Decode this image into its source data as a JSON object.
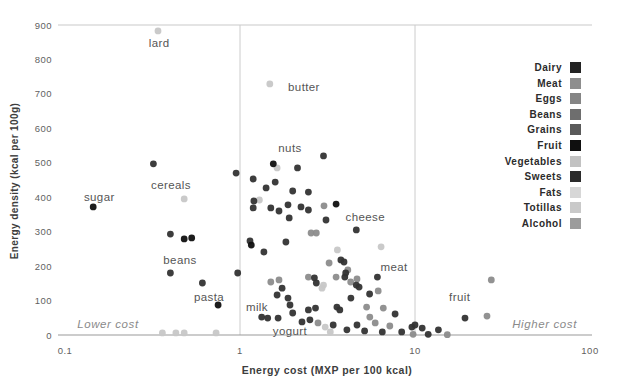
{
  "chart_data": {
    "type": "scatter",
    "title": "",
    "xlabel": "Energy cost (MXP per 100 kcal)",
    "ylabel": "Energy density (kcal per 100g)",
    "x_scale": "log",
    "xlim": [
      0.1,
      100
    ],
    "ylim": [
      0,
      900
    ],
    "x_ticks": [
      0.1,
      1,
      10,
      100
    ],
    "x_tick_labels": [
      "0.1",
      "1",
      "10",
      "100"
    ],
    "y_ticks": [
      0,
      100,
      200,
      300,
      400,
      500,
      600,
      700,
      800,
      900
    ],
    "reference_lines_x": [
      1,
      10
    ],
    "grid": "top-line-and-baseline-only",
    "legend_position": "right",
    "palette": {
      "black": "#101010",
      "dark": "#333333",
      "medium": "#8c8c8c",
      "light": "#c7c7c7"
    },
    "points": [
      [
        0.34,
        883,
        "light"
      ],
      [
        1.48,
        729,
        "light"
      ],
      [
        0.48,
        395,
        "light"
      ],
      [
        1.63,
        485,
        "light"
      ],
      [
        1.29,
        392,
        "light"
      ],
      [
        3.6,
        247,
        "light"
      ],
      [
        6.4,
        256,
        "light"
      ],
      [
        3.0,
        145,
        "light"
      ],
      [
        2.94,
        136,
        "light"
      ],
      [
        3.07,
        23,
        "light"
      ],
      [
        3.28,
        9,
        "light"
      ],
      [
        0.36,
        6,
        "light"
      ],
      [
        0.43,
        6,
        "light"
      ],
      [
        0.48,
        6,
        "light"
      ],
      [
        0.73,
        6,
        "light"
      ],
      [
        3.02,
        375,
        "medium"
      ],
      [
        2.55,
        296,
        "medium"
      ],
      [
        2.73,
        296,
        "medium"
      ],
      [
        3.23,
        209,
        "medium"
      ],
      [
        1.5,
        154,
        "medium"
      ],
      [
        1.67,
        160,
        "medium"
      ],
      [
        2.46,
        168,
        "medium"
      ],
      [
        3.54,
        168,
        "medium"
      ],
      [
        4.29,
        154,
        "medium"
      ],
      [
        4.13,
        189,
        "medium"
      ],
      [
        2.79,
        35,
        "medium"
      ],
      [
        4.66,
        163,
        "medium"
      ],
      [
        6.16,
        128,
        "medium"
      ],
      [
        5.29,
        81,
        "medium"
      ],
      [
        6.59,
        78,
        "medium"
      ],
      [
        5.52,
        52,
        "medium"
      ],
      [
        5.92,
        35,
        "medium"
      ],
      [
        7.18,
        26,
        "medium"
      ],
      [
        9.75,
        2,
        "medium"
      ],
      [
        15.3,
        1,
        "medium"
      ],
      [
        25.8,
        55,
        "medium"
      ],
      [
        27.3,
        160,
        "medium"
      ],
      [
        0.32,
        497,
        "dark"
      ],
      [
        0.4,
        293,
        "dark"
      ],
      [
        0.4,
        180,
        "dark"
      ],
      [
        0.61,
        151,
        "dark"
      ],
      [
        0.95,
        470,
        "dark"
      ],
      [
        3.0,
        520,
        "dark"
      ],
      [
        2.13,
        485,
        "dark"
      ],
      [
        1.19,
        453,
        "dark"
      ],
      [
        1.59,
        444,
        "dark"
      ],
      [
        1.41,
        427,
        "dark"
      ],
      [
        2.0,
        418,
        "dark"
      ],
      [
        2.46,
        415,
        "dark"
      ],
      [
        1.2,
        389,
        "dark"
      ],
      [
        1.19,
        369,
        "dark"
      ],
      [
        1.5,
        369,
        "dark"
      ],
      [
        1.67,
        360,
        "dark"
      ],
      [
        1.88,
        378,
        "dark"
      ],
      [
        2.23,
        372,
        "dark"
      ],
      [
        2.46,
        363,
        "dark"
      ],
      [
        1.91,
        340,
        "dark"
      ],
      [
        3.1,
        334,
        "dark"
      ],
      [
        4.62,
        305,
        "dark"
      ],
      [
        1.14,
        273,
        "dark"
      ],
      [
        1.83,
        270,
        "dark"
      ],
      [
        1.37,
        241,
        "dark"
      ],
      [
        3.77,
        218,
        "dark"
      ],
      [
        3.93,
        212,
        "dark"
      ],
      [
        0.97,
        180,
        "dark"
      ],
      [
        2.73,
        151,
        "dark"
      ],
      [
        4.02,
        180,
        "dark"
      ],
      [
        4.62,
        145,
        "dark"
      ],
      [
        2.66,
        166,
        "dark"
      ],
      [
        3.97,
        168,
        "dark"
      ],
      [
        1.74,
        136,
        "dark"
      ],
      [
        1.63,
        116,
        "dark"
      ],
      [
        1.88,
        107,
        "dark"
      ],
      [
        1.93,
        87,
        "dark"
      ],
      [
        2.0,
        64,
        "dark"
      ],
      [
        2.46,
        73,
        "dark"
      ],
      [
        2.7,
        78,
        "dark"
      ],
      [
        3.58,
        81,
        "dark"
      ],
      [
        3.72,
        73,
        "dark"
      ],
      [
        4.3,
        107,
        "dark"
      ],
      [
        1.33,
        52,
        "dark"
      ],
      [
        1.44,
        49,
        "dark"
      ],
      [
        1.65,
        49,
        "dark"
      ],
      [
        2.26,
        38,
        "dark"
      ],
      [
        2.51,
        44,
        "dark"
      ],
      [
        3.41,
        29,
        "dark"
      ],
      [
        4.08,
        15,
        "dark"
      ],
      [
        6.1,
        168,
        "dark"
      ],
      [
        4.79,
        139,
        "dark"
      ],
      [
        5.5,
        119,
        "dark"
      ],
      [
        7.7,
        61,
        "dark"
      ],
      [
        4.66,
        29,
        "dark"
      ],
      [
        5.15,
        12,
        "dark"
      ],
      [
        6.5,
        9,
        "dark"
      ],
      [
        8.4,
        9,
        "dark"
      ],
      [
        9.6,
        23,
        "dark"
      ],
      [
        10.0,
        29,
        "dark"
      ],
      [
        11.0,
        20,
        "dark"
      ],
      [
        11.9,
        2,
        "dark"
      ],
      [
        13.6,
        15,
        "dark"
      ],
      [
        19.3,
        49,
        "dark"
      ],
      [
        0.145,
        372,
        "black"
      ],
      [
        0.48,
        279,
        "black"
      ],
      [
        0.53,
        282,
        "black"
      ],
      [
        0.75,
        87,
        "black"
      ],
      [
        1.55,
        497,
        "black"
      ],
      [
        1.16,
        261,
        "black"
      ],
      [
        3.54,
        380,
        "black"
      ]
    ],
    "annotations": [
      {
        "text": "lard",
        "x": 0.345,
        "y": 848
      },
      {
        "text": "butter",
        "x": 2.32,
        "y": 720
      },
      {
        "text": "sugar",
        "x": 0.157,
        "y": 401
      },
      {
        "text": "cereals",
        "x": 0.403,
        "y": 436
      },
      {
        "text": "beans",
        "x": 0.454,
        "y": 218
      },
      {
        "text": "pasta",
        "x": 0.665,
        "y": 110
      },
      {
        "text": "nuts",
        "x": 1.93,
        "y": 543
      },
      {
        "text": "cheese",
        "x": 5.2,
        "y": 343
      },
      {
        "text": "meat",
        "x": 7.6,
        "y": 197
      },
      {
        "text": "fruit",
        "x": 18.0,
        "y": 110
      },
      {
        "text": "milk",
        "x": 1.25,
        "y": 81
      },
      {
        "text": "yogurt",
        "x": 1.93,
        "y": 12
      }
    ],
    "zone_labels": [
      {
        "text": "Lower cost",
        "x": 0.176,
        "y": 32
      },
      {
        "text": "Higher cost",
        "x": 55,
        "y": 32
      }
    ]
  },
  "legend": {
    "items": [
      {
        "label": "Dairy",
        "color": "#232323"
      },
      {
        "label": "Meat",
        "color": "#8e8e8e"
      },
      {
        "label": "Eggs",
        "color": "#858585"
      },
      {
        "label": "Beans",
        "color": "#6e6e6e"
      },
      {
        "label": "Grains",
        "color": "#5a5a5a"
      },
      {
        "label": "Fruit",
        "color": "#0f0f0f"
      },
      {
        "label": "Vegetables",
        "color": "#c2c2c2"
      },
      {
        "label": "Sweets",
        "color": "#2b2b2b"
      },
      {
        "label": "Fats",
        "color": "#d7d7d7"
      },
      {
        "label": "Totillas",
        "color": "#c9c9c9"
      },
      {
        "label": "Alcohol",
        "color": "#9c9c9c"
      }
    ]
  }
}
